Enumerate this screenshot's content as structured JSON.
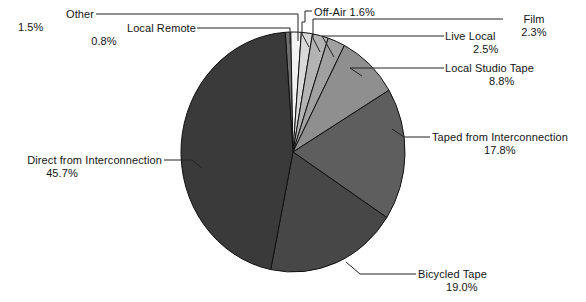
{
  "chart_data": {
    "type": "pie",
    "title": "",
    "units": "percent",
    "total": 100.0,
    "start_angle_deg": -4,
    "direction": "clockwise",
    "legend": "none",
    "labels_style": "outside-with-leader-lines",
    "categories": [
      "Local Remote",
      "Other",
      "Off-Air",
      "Film",
      "Live Local",
      "Local Studio Tape",
      "Taped from Interconnection",
      "Bicycled Tape",
      "Direct from Interconnection"
    ],
    "values": [
      0.8,
      1.5,
      1.6,
      2.3,
      2.5,
      8.8,
      17.8,
      19.0,
      45.7
    ],
    "value_labels": [
      "0.8%",
      "1.5%",
      "1.6%",
      "2.3%",
      "2.5%",
      "8.8%",
      "17.8%",
      "19.0%",
      "45.7%"
    ],
    "slice_colors": [
      "#6e6e6e",
      "#f2f2f2",
      "#d9d9d9",
      "#b3b3b3",
      "#a0a0a0",
      "#8f8f8f",
      "#5e5e5e",
      "#474747",
      "#3a3a3a"
    ],
    "slice_stroke": "#111111",
    "leader_line_color": "#222222"
  },
  "labels": {
    "other": {
      "name": "Other",
      "value": "1.5%"
    },
    "local_remote": {
      "name": "Local Remote",
      "value": "0.8%"
    },
    "off_air": {
      "name": "Off-Air",
      "value": "1.6%"
    },
    "film": {
      "name": "Film",
      "value": "2.3%"
    },
    "live_local": {
      "name": "Live Local",
      "value": "2.5%"
    },
    "studio_tape": {
      "name": "Local Studio Tape",
      "value": "8.8%"
    },
    "taped_inter": {
      "name": "Taped from Interconnection",
      "value": "17.8%"
    },
    "bicycled": {
      "name": "Bicycled Tape",
      "value": "19.0%"
    },
    "direct_inter": {
      "name": "Direct from Interconnection",
      "value": "45.7%"
    }
  }
}
